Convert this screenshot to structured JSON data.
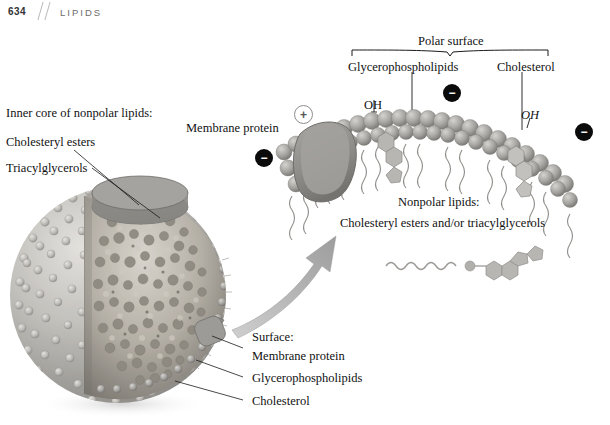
{
  "page": {
    "folio": "634",
    "section": "LIPIDS",
    "slash": "//"
  },
  "figure": {
    "left_panel": {
      "heading": "Inner core of nonpolar lipids:",
      "items": [
        "Cholesteryl esters",
        "Triacylglycerols"
      ]
    },
    "bottom_panel": {
      "heading": "Surface:",
      "items": [
        "Membrane protein",
        "Glycerophospholipids",
        "Cholesterol"
      ]
    },
    "detail_panel": {
      "bracket_label": "Polar surface",
      "component_labels": [
        "Glycerophospholipids",
        "Cholesterol"
      ],
      "protein_label": "Membrane protein",
      "hydroxyl_left": "OH",
      "hydroxyl_right": "OH",
      "core_heading": "Nonpolar lipids:",
      "core_text": "Cholesteryl esters and/or triacylglycerols"
    },
    "charges": [
      {
        "sign": "−",
        "name": "negative-charge-left"
      },
      {
        "sign": "+",
        "name": "positive-charge"
      },
      {
        "sign": "−",
        "name": "negative-charge-middle"
      },
      {
        "sign": "−",
        "name": "negative-charge-right"
      }
    ],
    "colors": {
      "text": "#111111",
      "header_rule": "#b9b9b9",
      "section": "#6d6d6d",
      "lipid_gray": "#9a9a9a",
      "protein_gray": "#8f8f8f",
      "core_gray": "#a8a39b",
      "arrow_gray": "#a9a9a9",
      "charge_negative": "#0b0b0b",
      "charge_positive_border": "#8d8d8d"
    }
  }
}
